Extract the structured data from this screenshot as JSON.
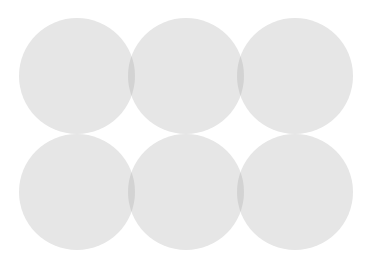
{
  "diagram": {
    "type": "overlapping-circles",
    "width": 372,
    "height": 266,
    "colors": {
      "background": "#ffffff",
      "circle_fill": "#e6e6e6",
      "overlap_fill": "#d3d3d3"
    },
    "circles": [
      {
        "id": "top-left",
        "cx": 77,
        "cy": 76,
        "r": 58
      },
      {
        "id": "top-middle",
        "cx": 186,
        "cy": 76,
        "r": 58
      },
      {
        "id": "top-right",
        "cx": 295,
        "cy": 76,
        "r": 58
      },
      {
        "id": "bottom-left",
        "cx": 77,
        "cy": 192,
        "r": 58
      },
      {
        "id": "bottom-middle",
        "cx": 186,
        "cy": 192,
        "r": 58
      },
      {
        "id": "bottom-right",
        "cx": 295,
        "cy": 192,
        "r": 58
      }
    ]
  }
}
